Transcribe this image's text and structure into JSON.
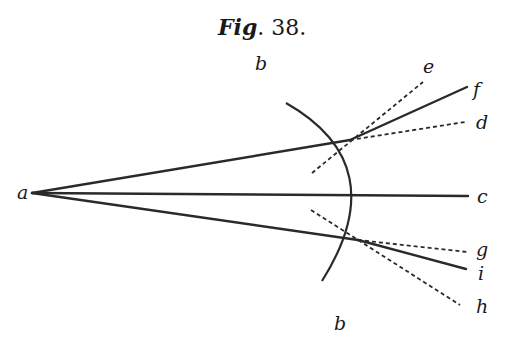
{
  "figure": {
    "title_prefix": "Fig",
    "title_suffix": ". 38.",
    "labels": {
      "a": "a",
      "b_top": "b",
      "b_bottom": "b",
      "c": "c",
      "d": "d",
      "e": "e",
      "f": "f",
      "g": "g",
      "h": "h",
      "i": "i"
    },
    "colors": {
      "ink": "#2a2a2a",
      "background": "#ffffff"
    }
  }
}
